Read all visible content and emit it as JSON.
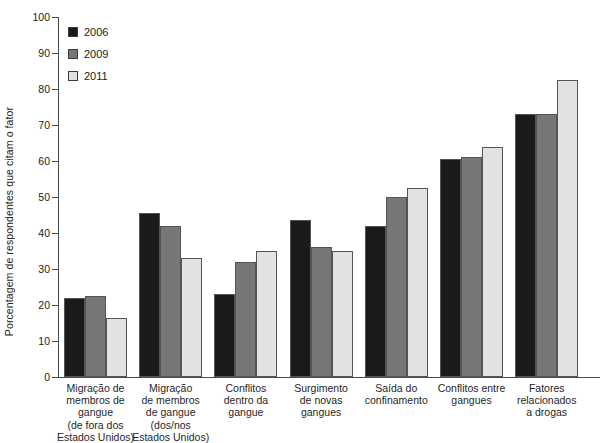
{
  "chart_data": {
    "type": "bar",
    "title": "",
    "xlabel": "",
    "ylabel": "Porcentagem de respondentes que citam o fator",
    "ylim": [
      0,
      100
    ],
    "ytick_values": [
      0,
      10,
      20,
      30,
      40,
      50,
      60,
      70,
      80,
      90,
      100
    ],
    "ytick_labels": [
      "0",
      "10",
      "20",
      "30",
      "40",
      "50",
      "60",
      "70",
      "80",
      "90",
      "100"
    ],
    "grid": false,
    "legend_position": "top-left",
    "categories": [
      "Migração de membros de gangue (de fora dos Estados Unidos)",
      "Migração de membros de gangue (dos/nos Estados Unidos)",
      "Conflitos dentro da gangue",
      "Surgimento de novas gangues",
      "Saída do confinamento",
      "Conflitos entre gangues",
      "Fatores relacionados a drogas"
    ],
    "category_lines": [
      [
        "Migração de",
        "membros de",
        "gangue",
        "(de fora dos",
        "Estados Unidos)"
      ],
      [
        "Migração",
        "de membros",
        "de gangue",
        "(dos/nos",
        "Estados Unidos)"
      ],
      [
        "Conflitos",
        "dentro da",
        "gangue"
      ],
      [
        "Surgimento",
        "de novas",
        "gangues"
      ],
      [
        "Saída do",
        "confinamento"
      ],
      [
        "Conflitos entre",
        "gangues"
      ],
      [
        "Fatores",
        "relacionados",
        "a drogas"
      ]
    ],
    "series": [
      {
        "name": "2006",
        "color": "#1a1a1a",
        "values": [
          22,
          45.5,
          23,
          43.5,
          42,
          60.5,
          73
        ]
      },
      {
        "name": "2009",
        "color": "#777777",
        "values": [
          22.5,
          42,
          32,
          36,
          50,
          61,
          73
        ]
      },
      {
        "name": "2011",
        "color": "#e2e2e2",
        "values": [
          16.5,
          33,
          35,
          35,
          52.5,
          64,
          82.5
        ]
      }
    ]
  },
  "legend": {
    "items": [
      {
        "label": "2006",
        "color": "#1a1a1a"
      },
      {
        "label": "2009",
        "color": "#777777"
      },
      {
        "label": "2011",
        "color": "#e2e2e2"
      }
    ]
  },
  "axis": {
    "y_title": "Porcentagem de respondentes que citam o fator"
  }
}
